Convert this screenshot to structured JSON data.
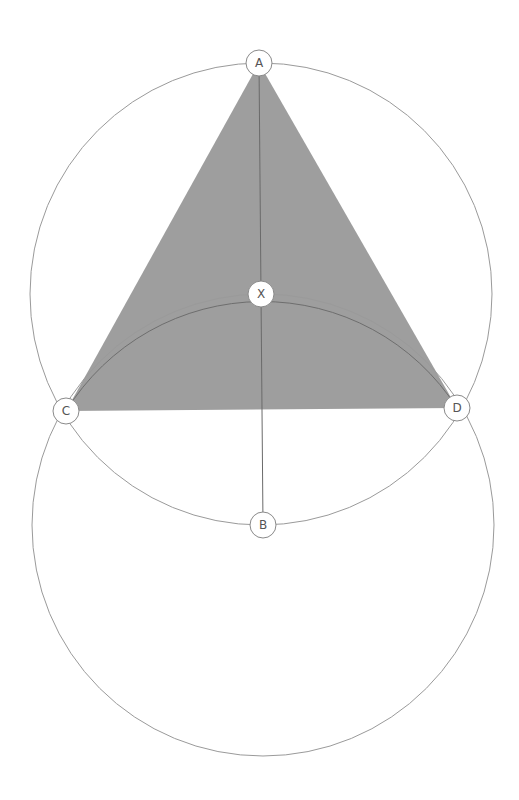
{
  "diagram": {
    "title": "",
    "colors": {
      "triangle_fill": "#9e9e9e",
      "circle_stroke": "#9a9a9a",
      "background": "#ffffff"
    },
    "points": [
      {
        "id": "A",
        "label": "A"
      },
      {
        "id": "X",
        "label": "X"
      },
      {
        "id": "C",
        "label": "C"
      },
      {
        "id": "D",
        "label": "D"
      },
      {
        "id": "B",
        "label": "B"
      }
    ],
    "circles": [
      {
        "id": "upper-circle",
        "center": "X",
        "through": [
          "A",
          "C",
          "D",
          "B"
        ]
      },
      {
        "id": "lower-circle",
        "center": "B",
        "through": [
          "X",
          "C",
          "D"
        ]
      }
    ],
    "shaded_triangle": [
      "A",
      "C",
      "D"
    ],
    "segments": [
      [
        "A",
        "B"
      ]
    ]
  }
}
